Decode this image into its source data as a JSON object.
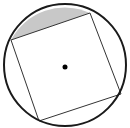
{
  "diagram": {
    "circle": {
      "cx": 65,
      "cy": 65,
      "r": 61,
      "stroke": "#1a1a1a",
      "stroke_width": 2
    },
    "square": {
      "vertices": [
        [
          11,
          40
        ],
        [
          90,
          13
        ],
        [
          121,
          94
        ],
        [
          39,
          121
        ]
      ],
      "stroke": "#333333",
      "stroke_width": 1
    },
    "center_point": {
      "cx": 65,
      "cy": 67,
      "r": 2.5,
      "fill": "#000000"
    },
    "shaded_segment": {
      "chord_from": [
        11,
        40
      ],
      "chord_to": [
        90,
        13
      ],
      "fill": "#c8c8c8"
    },
    "background": "#ffffff"
  }
}
